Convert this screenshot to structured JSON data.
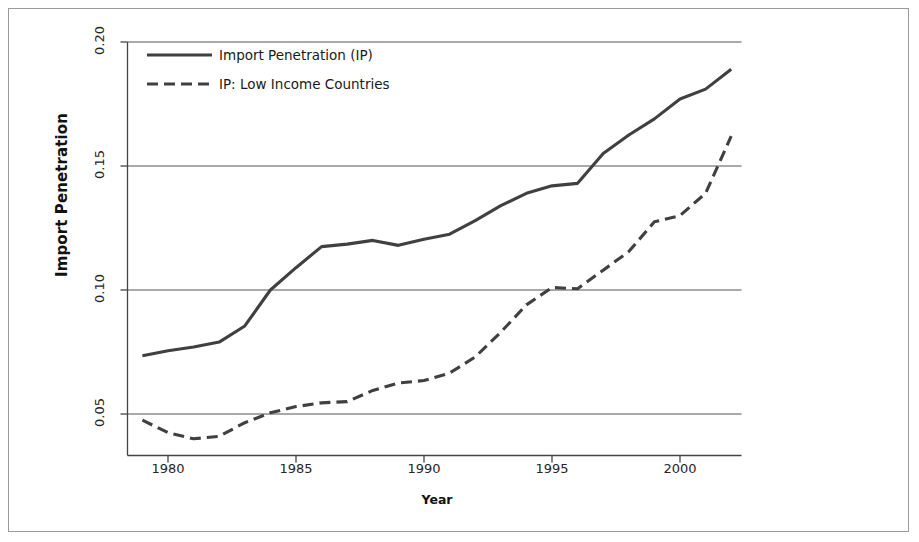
{
  "chart_data": {
    "type": "line",
    "title": "",
    "xlabel": "Year",
    "ylabel": "Import Penetration",
    "xlim": [
      1979,
      2002
    ],
    "ylim": [
      0.036,
      0.205
    ],
    "grid": "horizontal",
    "legend_position": "top-left inside plot",
    "xticks": [
      "1980",
      "1985",
      "1990",
      "1995",
      "2000"
    ],
    "xtick_values": [
      1980,
      1985,
      1990,
      1995,
      2000
    ],
    "yticks": [
      "0.05",
      "0.10",
      "0.15",
      "0.20"
    ],
    "ytick_values": [
      0.05,
      0.1,
      0.15,
      0.2
    ],
    "x": [
      1979,
      1980,
      1981,
      1982,
      1983,
      1984,
      1985,
      1986,
      1987,
      1988,
      1989,
      1990,
      1991,
      1992,
      1993,
      1994,
      1995,
      1996,
      1997,
      1998,
      1999,
      2000,
      2001,
      2002
    ],
    "series": [
      {
        "name": "Import Penetration (IP)",
        "style": "solid",
        "color": "#404040",
        "values": [
          0.0735,
          0.0755,
          0.077,
          0.079,
          0.0855,
          0.1,
          0.109,
          0.1175,
          0.1185,
          0.12,
          0.118,
          0.1205,
          0.1225,
          0.128,
          0.134,
          0.139,
          0.142,
          0.143,
          0.155,
          0.1625,
          0.169,
          0.177,
          0.181,
          0.189
        ]
      },
      {
        "name": "IP: Low Income Countries",
        "style": "dashed",
        "color": "#404040",
        "values": [
          0.0475,
          0.0425,
          0.04,
          0.041,
          0.0465,
          0.0505,
          0.053,
          0.0545,
          0.055,
          0.0595,
          0.0625,
          0.0635,
          0.0665,
          0.073,
          0.083,
          0.094,
          0.101,
          0.1005,
          0.108,
          0.1155,
          0.1275,
          0.13,
          0.139,
          0.162
        ]
      }
    ]
  },
  "legend": {
    "items": [
      {
        "label": "Import Penetration (IP)",
        "style": "solid"
      },
      {
        "label": "IP: Low Income Countries",
        "style": "dashed"
      }
    ]
  },
  "axes": {
    "y_title": "Import Penetration",
    "x_title": "Year"
  }
}
